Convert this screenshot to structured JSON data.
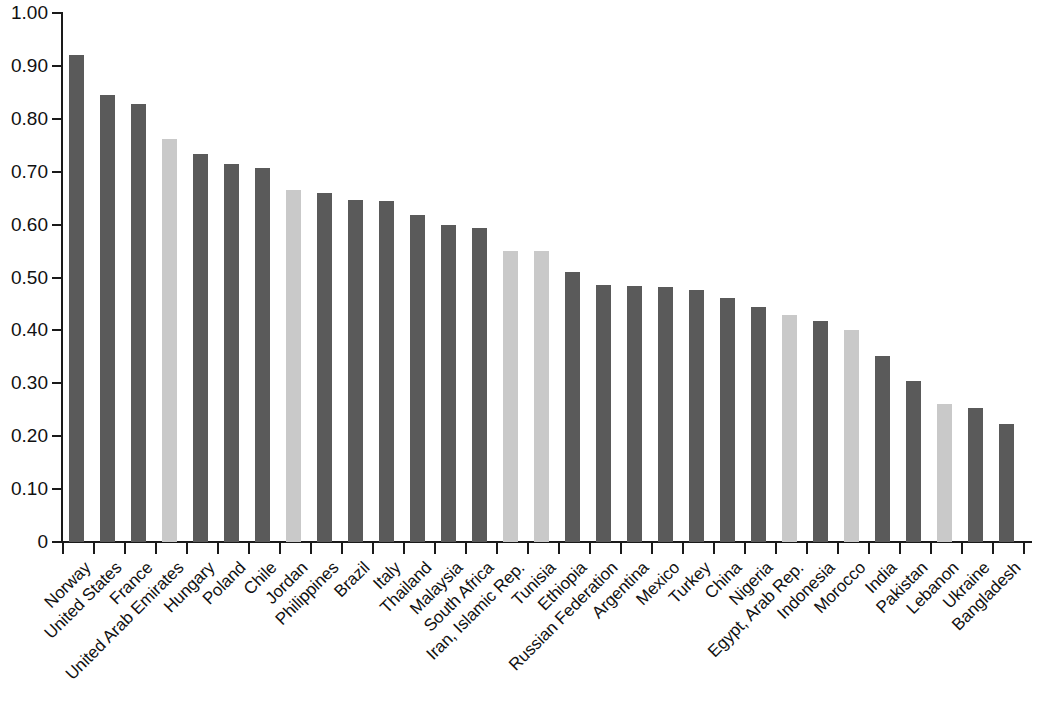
{
  "chart_data": {
    "type": "bar",
    "title": "",
    "subtitle": "",
    "xlabel": "",
    "ylabel": "",
    "ylim": [
      0,
      1.0
    ],
    "grid": false,
    "legend": "none",
    "y_ticks": [
      "0",
      "0.10",
      "0.20",
      "0.30",
      "0.40",
      "0.50",
      "0.60",
      "0.70",
      "0.80",
      "0.90",
      "1.00"
    ],
    "y_tick_values": [
      0,
      0.1,
      0.2,
      0.3,
      0.4,
      0.5,
      0.6,
      0.7,
      0.8,
      0.9,
      1.0
    ],
    "categories": [
      "Norway",
      "United States",
      "France",
      "United Arab Emirates",
      "Hungary",
      "Poland",
      "Chile",
      "Jordan",
      "Philippines",
      "Brazil",
      "Italy",
      "Thailand",
      "Malaysia",
      "South Africa",
      "Iran, Islamic Rep.",
      "Tunisia",
      "Ethiopia",
      "Russian Federation",
      "Argentina",
      "Mexico",
      "Turkey",
      "China",
      "Nigeria",
      "Egypt, Arab Rep.",
      "Indonesia",
      "Morocco",
      "India",
      "Pakistan",
      "Lebanon",
      "Ukraine",
      "Bangladesh"
    ],
    "values": [
      0.921,
      0.845,
      0.828,
      0.761,
      0.733,
      0.715,
      0.707,
      0.666,
      0.659,
      0.646,
      0.645,
      0.619,
      0.6,
      0.594,
      0.551,
      0.55,
      0.51,
      0.486,
      0.484,
      0.482,
      0.476,
      0.461,
      0.445,
      0.43,
      0.417,
      0.4,
      0.351,
      0.305,
      0.261,
      0.254,
      0.223
    ],
    "bar_shades": [
      "dark",
      "dark",
      "dark",
      "light",
      "dark",
      "dark",
      "dark",
      "light",
      "dark",
      "dark",
      "dark",
      "dark",
      "dark",
      "dark",
      "light",
      "light",
      "dark",
      "dark",
      "dark",
      "dark",
      "dark",
      "dark",
      "dark",
      "light",
      "dark",
      "light",
      "dark",
      "dark",
      "light",
      "dark",
      "dark"
    ]
  },
  "colors": {
    "bar_dark": "#5a5a5a",
    "bar_light": "#c9c9c9",
    "bar_light_medium": "#b4b4b4",
    "axis": "#1a1a1a",
    "text": "#111111",
    "background": "#ffffff"
  }
}
